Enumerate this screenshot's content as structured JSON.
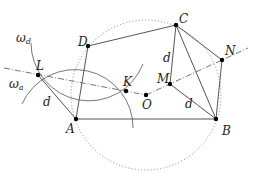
{
  "figure": {
    "points": {
      "A": {
        "label": "A",
        "x": 76,
        "y": 119
      },
      "B": {
        "label": "B",
        "x": 216,
        "y": 119
      },
      "C": {
        "label": "C",
        "x": 176,
        "y": 25
      },
      "D": {
        "label": "D",
        "x": 88,
        "y": 46
      },
      "L": {
        "label": "L",
        "x": 38,
        "y": 75
      },
      "K": {
        "label": "K",
        "x": 126,
        "y": 91
      },
      "O": {
        "label": "O",
        "x": 146,
        "y": 95
      },
      "M": {
        "label": "M",
        "x": 170,
        "y": 84
      },
      "N": {
        "label": "N",
        "x": 222,
        "y": 60
      }
    },
    "circles": {
      "omega_d": {
        "label": "ω",
        "subscript": "d",
        "center": "D"
      },
      "omega_a": {
        "label": "ω",
        "subscript": "a",
        "center": "A"
      },
      "circumcircle": {
        "center": "O",
        "style": "dotted"
      }
    },
    "segment_labels": {
      "LA": "d",
      "CM": "d",
      "MB": "d"
    }
  }
}
